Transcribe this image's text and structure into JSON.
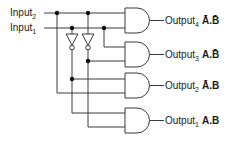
{
  "inputs": [
    {
      "name": "Input",
      "subscript": "2"
    },
    {
      "name": "Input",
      "subscript": "1"
    }
  ],
  "outputs": [
    {
      "name": "Output",
      "subscript": "4",
      "expression": "Ā.B̄"
    },
    {
      "name": "Output",
      "subscript": "3",
      "expression": "A.B̄"
    },
    {
      "name": "Output",
      "subscript": "2",
      "expression": "Ā.B"
    },
    {
      "name": "Output",
      "subscript": "1",
      "expression": "A.B"
    }
  ],
  "colors": {
    "wire": "#3a3a3a",
    "junction": "#111111",
    "text": "#1a1a1a"
  }
}
